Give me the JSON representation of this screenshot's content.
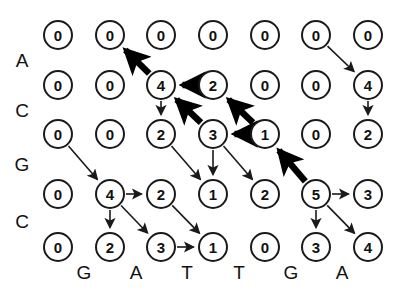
{
  "figure": {
    "type": "alignment-dynamic-programming-grid",
    "rows": 5,
    "cols": 7,
    "colors": {
      "node_stroke": "#1a1a1a",
      "text": "#111111",
      "background": "#ffffff",
      "thin_edge": "#1a1a1a",
      "bold_edge": "#000000"
    }
  },
  "row_labels": [
    "A",
    "C",
    "G",
    "C"
  ],
  "col_labels": [
    "G",
    "A",
    "T",
    "T",
    "G",
    "A"
  ],
  "grid": [
    {
      "row": 1,
      "values": [
        "0",
        "0",
        "0",
        "0",
        "0",
        "0",
        "0"
      ]
    },
    {
      "row": 2,
      "values": [
        "0",
        "0",
        "4",
        "2",
        "0",
        "0",
        "4"
      ]
    },
    {
      "row": 3,
      "values": [
        "0",
        "0",
        "2",
        "3",
        "1",
        "0",
        "2"
      ]
    },
    {
      "row": 4,
      "values": [
        "0",
        "4",
        "2",
        "1",
        "2",
        "5",
        "3"
      ]
    },
    {
      "row": 5,
      "values": [
        "0",
        "2",
        "3",
        "1",
        "0",
        "3",
        "4"
      ]
    }
  ],
  "geometry": {
    "col_x": [
      58,
      110,
      161,
      213,
      265,
      316,
      368
    ],
    "row_y": [
      35,
      85,
      134,
      194,
      247
    ],
    "row_label_x": 22,
    "row_label_y": [
      60,
      110,
      164,
      221
    ],
    "col_label_y": 272,
    "col_label_x": [
      84,
      136,
      187,
      239,
      291,
      342
    ]
  },
  "edges_thin": [
    {
      "from": [
        1,
        6
      ],
      "to": [
        2,
        7
      ]
    },
    {
      "from": [
        2,
        7
      ],
      "to": [
        3,
        7
      ]
    },
    {
      "from": [
        2,
        3
      ],
      "to": [
        3,
        3
      ]
    },
    {
      "from": [
        3,
        1
      ],
      "to": [
        4,
        2
      ]
    },
    {
      "from": [
        3,
        3
      ],
      "to": [
        4,
        4
      ]
    },
    {
      "from": [
        3,
        4
      ],
      "to": [
        4,
        4
      ]
    },
    {
      "from": [
        3,
        4
      ],
      "to": [
        4,
        5
      ]
    },
    {
      "from": [
        4,
        2
      ],
      "to": [
        4,
        3
      ]
    },
    {
      "from": [
        4,
        2
      ],
      "to": [
        5,
        2
      ]
    },
    {
      "from": [
        4,
        2
      ],
      "to": [
        5,
        3
      ]
    },
    {
      "from": [
        4,
        3
      ],
      "to": [
        5,
        4
      ]
    },
    {
      "from": [
        4,
        6
      ],
      "to": [
        4,
        7
      ]
    },
    {
      "from": [
        4,
        6
      ],
      "to": [
        5,
        6
      ]
    },
    {
      "from": [
        4,
        6
      ],
      "to": [
        5,
        7
      ]
    },
    {
      "from": [
        5,
        3
      ],
      "to": [
        5,
        4
      ]
    }
  ],
  "edges_bold": [
    {
      "from": [
        2,
        3
      ],
      "to": [
        1,
        2
      ]
    },
    {
      "from": [
        2,
        4
      ],
      "to": [
        2,
        3
      ]
    },
    {
      "from": [
        3,
        4
      ],
      "to": [
        2,
        3
      ]
    },
    {
      "from": [
        3,
        5
      ],
      "to": [
        2,
        4
      ]
    },
    {
      "from": [
        3,
        5
      ],
      "to": [
        3,
        4
      ]
    },
    {
      "from": [
        4,
        6
      ],
      "to": [
        3,
        5
      ]
    }
  ]
}
